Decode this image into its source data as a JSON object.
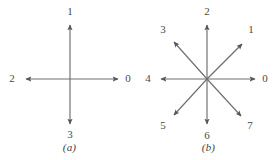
{
  "figure": {
    "background_color": "#ffffff",
    "stroke_color": "#6e6e6e",
    "label_color": "#4a4a4a"
  },
  "panels": [
    {
      "id": "a",
      "caption": "(a)",
      "title_code": "4-direction chain code",
      "center": {
        "x": 70,
        "y": 79
      },
      "arrow_length": 46,
      "directions": [
        {
          "label": "0",
          "angle_deg": 0,
          "dx": 1,
          "dy": 0,
          "label_x": 128,
          "label_y": 79
        },
        {
          "label": "1",
          "angle_deg": 90,
          "dx": 0,
          "dy": -1,
          "label_x": 70,
          "label_y": 12
        },
        {
          "label": "2",
          "angle_deg": 180,
          "dx": -1,
          "dy": 0,
          "label_x": 12,
          "label_y": 79
        },
        {
          "label": "3",
          "angle_deg": 270,
          "dx": 0,
          "dy": 1,
          "label_x": 70,
          "label_y": 135
        }
      ]
    },
    {
      "id": "b",
      "caption": "(b)",
      "title_code": "8-direction chain code",
      "center": {
        "x": 68,
        "y": 79
      },
      "arrow_length": 46,
      "diagonal_length": 46,
      "directions": [
        {
          "label": "0",
          "angle_deg": 0,
          "dx": 1,
          "dy": 0,
          "label_x": 126,
          "label_y": 79
        },
        {
          "label": "1",
          "angle_deg": 45,
          "dx": 0.707,
          "dy": -0.707,
          "label_x": 112,
          "label_y": 28
        },
        {
          "label": "2",
          "angle_deg": 90,
          "dx": 0,
          "dy": -1,
          "label_x": 68,
          "label_y": 12
        },
        {
          "label": "3",
          "angle_deg": 135,
          "dx": -0.707,
          "dy": -0.707,
          "label_x": 24,
          "label_y": 28
        },
        {
          "label": "4",
          "angle_deg": 180,
          "dx": -1,
          "dy": 0,
          "label_x": 9,
          "label_y": 79
        },
        {
          "label": "5",
          "angle_deg": 225,
          "dx": -0.707,
          "dy": 0.707,
          "label_x": 24,
          "label_y": 128
        },
        {
          "label": "6",
          "angle_deg": 270,
          "dx": 0,
          "dy": 1,
          "label_x": 68,
          "label_y": 136
        },
        {
          "label": "7",
          "angle_deg": 315,
          "dx": 0.707,
          "dy": 0.707,
          "label_x": 111,
          "label_y": 128
        }
      ]
    }
  ]
}
